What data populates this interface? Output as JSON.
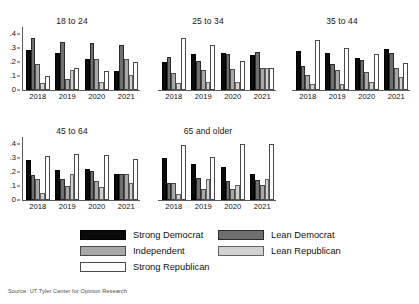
{
  "source_note": "Source: UT Tyler Center for Opinion Research",
  "legend": {
    "items": [
      {
        "key": "strong_democrat",
        "label": "Strong Democrat",
        "color": "#0a0a0a"
      },
      {
        "key": "lean_democrat",
        "label": "Lean Democrat",
        "color": "#6f6f6f"
      },
      {
        "key": "independent",
        "label": "Independent",
        "color": "#a8a8a8"
      },
      {
        "key": "lean_republican",
        "label": "Lean Republican",
        "color": "#d2d2d2"
      },
      {
        "key": "strong_republican",
        "label": "Strong Republican",
        "color": "#ffffff"
      }
    ]
  },
  "axis": {
    "yticks": [
      "0",
      ".1",
      ".2",
      ".3",
      ".4"
    ],
    "ymin": 0,
    "ymax": 0.45
  },
  "chart_data": {
    "type": "bar",
    "title": "",
    "xlabel": "",
    "ylabel": "",
    "ylim": [
      0,
      0.45
    ],
    "grid": false,
    "legend_position": "bottom",
    "categories": [
      "2018",
      "2019",
      "2020",
      "2021"
    ],
    "series_names": [
      "Strong Democrat",
      "Lean Democrat",
      "Independent",
      "Lean Republican",
      "Strong Republican"
    ],
    "panels": [
      {
        "name": "18 to 24",
        "series": [
          {
            "name": "Strong Democrat",
            "values": [
              0.285,
              0.265,
              0.225,
              0.135
            ]
          },
          {
            "name": "Lean Democrat",
            "values": [
              0.375,
              0.34,
              0.335,
              0.32
            ]
          },
          {
            "name": "Independent",
            "values": [
              0.185,
              0.08,
              0.225,
              0.225
            ]
          },
          {
            "name": "Lean Republican",
            "values": [
              0.05,
              0.145,
              0.06,
              0.11
            ]
          },
          {
            "name": "Strong Republican",
            "values": [
              0.1,
              0.16,
              0.135,
              0.2
            ]
          }
        ]
      },
      {
        "name": "25 to 34",
        "series": [
          {
            "name": "Strong Democrat",
            "values": [
              0.2,
              0.255,
              0.265,
              0.25
            ]
          },
          {
            "name": "Lean Democrat",
            "values": [
              0.235,
              0.205,
              0.255,
              0.275
            ]
          },
          {
            "name": "Independent",
            "values": [
              0.12,
              0.145,
              0.15,
              0.16
            ]
          },
          {
            "name": "Lean Republican",
            "values": [
              0.05,
              0.055,
              0.055,
              0.155
            ]
          },
          {
            "name": "Strong Republican",
            "values": [
              0.37,
              0.325,
              0.205,
              0.16
            ]
          }
        ]
      },
      {
        "name": "35 to 44",
        "series": [
          {
            "name": "Strong Democrat",
            "values": [
              0.28,
              0.265,
              0.23,
              0.295
            ]
          },
          {
            "name": "Lean Democrat",
            "values": [
              0.175,
              0.185,
              0.215,
              0.265
            ]
          },
          {
            "name": "Independent",
            "values": [
              0.11,
              0.145,
              0.13,
              0.155
            ]
          },
          {
            "name": "Lean Republican",
            "values": [
              0.045,
              0.04,
              0.06,
              0.09
            ]
          },
          {
            "name": "Strong Republican",
            "values": [
              0.355,
              0.3,
              0.255,
              0.195
            ]
          }
        ]
      },
      {
        "name": "45 to 64",
        "series": [
          {
            "name": "Strong Democrat",
            "values": [
              0.285,
              0.215,
              0.225,
              0.188
            ]
          },
          {
            "name": "Lean Democrat",
            "values": [
              0.18,
              0.15,
              0.205,
              0.188
            ]
          },
          {
            "name": "Independent",
            "values": [
              0.148,
              0.1,
              0.138,
              0.188
            ]
          },
          {
            "name": "Lean Republican",
            "values": [
              0.05,
              0.185,
              0.095,
              0.12
            ]
          },
          {
            "name": "Strong Republican",
            "values": [
              0.315,
              0.33,
              0.32,
              0.295
            ]
          }
        ]
      },
      {
        "name": "65 and older",
        "series": [
          {
            "name": "Strong Democrat",
            "values": [
              0.3,
              0.255,
              0.235,
              0.185
            ]
          },
          {
            "name": "Lean Democrat",
            "values": [
              0.12,
              0.155,
              0.135,
              0.14
            ]
          },
          {
            "name": "Independent",
            "values": [
              0.12,
              0.08,
              0.08,
              0.11
            ]
          },
          {
            "name": "Lean Republican",
            "values": [
              0.045,
              0.15,
              0.105,
              0.15
            ]
          },
          {
            "name": "Strong Republican",
            "values": [
              0.39,
              0.305,
              0.4,
              0.4
            ]
          }
        ]
      }
    ]
  }
}
